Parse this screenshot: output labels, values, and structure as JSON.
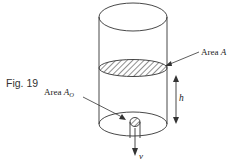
{
  "figure": {
    "caption": "Fig. 19",
    "labels": {
      "area_a_prefix": "Area ",
      "area_a_symbol": "A",
      "area_ao_prefix": "Area ",
      "area_ao_symbol": "A",
      "area_ao_subscript": "O",
      "height": "h",
      "velocity": "v"
    },
    "colors": {
      "stroke": "#333333",
      "hatch": "#444444",
      "background": "#ffffff"
    }
  }
}
